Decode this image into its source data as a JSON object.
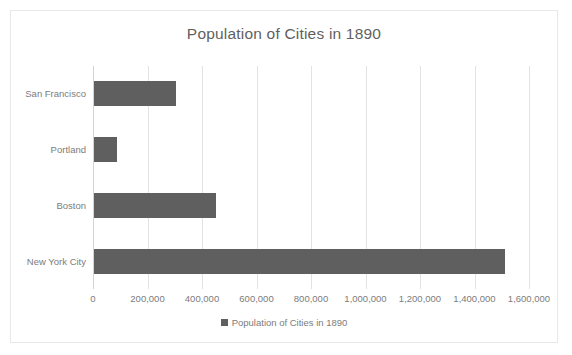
{
  "chart_data": {
    "type": "bar",
    "orientation": "horizontal",
    "title": "Population of Cities in 1890",
    "xlabel": "",
    "ylabel": "",
    "categories": [
      "New York City",
      "Boston",
      "Portland",
      "San Francisco"
    ],
    "values": [
      1510000,
      447000,
      84000,
      300000
    ],
    "series": [
      {
        "name": "Population of Cities in 1890",
        "values": [
          1510000,
          447000,
          84000,
          300000
        ],
        "color": "#5f5f5f"
      }
    ],
    "xlim": [
      0,
      1600000
    ],
    "xticks": [
      0,
      200000,
      400000,
      600000,
      800000,
      1000000,
      1200000,
      1400000,
      1600000
    ],
    "xtick_labels": [
      "0",
      "200,000",
      "400,000",
      "600,000",
      "800,000",
      "1,000,000",
      "1,200,000",
      "1,400,000",
      "1,600,000"
    ],
    "grid": "vertical",
    "legend": {
      "position": "bottom",
      "entries": [
        {
          "label": "Population of Cities in 1890",
          "color": "#5f5f5f",
          "marker": "square"
        }
      ]
    },
    "colors": {
      "bar": "#5f5f5f",
      "title_text": "#5f5f5f",
      "axis_text": "#7c7c7c",
      "gridline": "#e3e3e3",
      "frame_border": "#e8e8e8",
      "background": "#ffffff"
    }
  }
}
